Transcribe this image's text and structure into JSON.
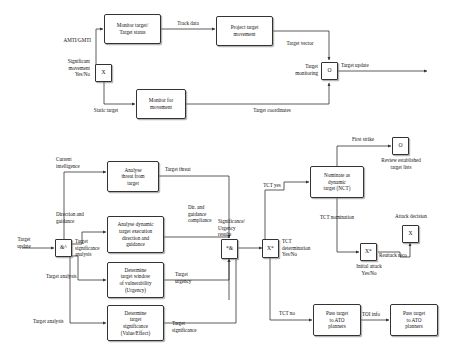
{
  "diagram": {
    "stroke_color": "#333333",
    "background": "#ffffff",
    "nodes": [
      {
        "id": "monitor_target",
        "label": "Monitor target/\nTarget status"
      },
      {
        "id": "project_movement",
        "label": "Project target\nmovement"
      },
      {
        "id": "x_sig_move",
        "label": "X"
      },
      {
        "id": "monitor_for_movement",
        "label": "Monitor for\nmovement"
      },
      {
        "id": "o_target_monitoring",
        "label": "O"
      },
      {
        "id": "amp_junction",
        "label": "&^"
      },
      {
        "id": "analyse_threat",
        "label": "Analyse\nthreat from\ntarget"
      },
      {
        "id": "analyse_dynamic",
        "label": "Analyse dynamic\ntarget execution\ndirection and\nguidance"
      },
      {
        "id": "determine_window",
        "label": "Determine\ntarget window\nof vulnerability\n(Urgency)"
      },
      {
        "id": "determine_significance",
        "label": "Determine\ntarget\nsignificance\n(Value/Effect)"
      },
      {
        "id": "star_amp_junction",
        "label": "*&"
      },
      {
        "id": "x_star_tct",
        "label": "X*"
      },
      {
        "id": "nominate_dynamic",
        "label": "Nominate as\ndynamic\ntarget (NCT)"
      },
      {
        "id": "o_review",
        "label": "O"
      },
      {
        "id": "x_star_initial_attack",
        "label": "X*"
      },
      {
        "id": "x_attack_decision",
        "label": "X"
      },
      {
        "id": "pass_ato_1",
        "label": "Pass target\nto ATO\nplanners"
      },
      {
        "id": "pass_ato_2",
        "label": "Pass target\nto ATO\nplanners"
      }
    ],
    "labels": [
      {
        "id": "amti_gmti",
        "text": "AMTI/GMTI"
      },
      {
        "id": "significant_movement",
        "text": "Significant\nmovement\nYes/No"
      },
      {
        "id": "static_target",
        "text": "Static target"
      },
      {
        "id": "track_data",
        "text": "Track data"
      },
      {
        "id": "target_vector",
        "text": "Target vector"
      },
      {
        "id": "target_monitoring",
        "text": "Target\nmonitoring"
      },
      {
        "id": "target_update_out",
        "text": "Target update"
      },
      {
        "id": "target_coordinates",
        "text": "Target coordinates"
      },
      {
        "id": "current_intelligence",
        "text": "Current\nintelligence"
      },
      {
        "id": "direction_and_guidance",
        "text": "Direction and\nguidance"
      },
      {
        "id": "target_update_in",
        "text": "Target\nupdate"
      },
      {
        "id": "target_significance_analysis",
        "text": "Target\nsignificance\nanalysis"
      },
      {
        "id": "target_analysis_1",
        "text": "Target analysis"
      },
      {
        "id": "target_analysis_2",
        "text": "Target analysis"
      },
      {
        "id": "target_threat",
        "text": "Target threat"
      },
      {
        "id": "dir_guidance_compliance",
        "text": "Dir. and\nguidance\ncompliance"
      },
      {
        "id": "target_urgency",
        "text": "Target\nurgency"
      },
      {
        "id": "target_significance_out",
        "text": "Target\nsignificance"
      },
      {
        "id": "significance_urgency_results",
        "text": "Significance/\nUrgency\nresults"
      },
      {
        "id": "tct_determination",
        "text": "TCT\ndetermination\nYes/No"
      },
      {
        "id": "tct_yes",
        "text": "TCT yes"
      },
      {
        "id": "tct_no",
        "text": "TCT no"
      },
      {
        "id": "tct_nomination",
        "text": "TCT nomination"
      },
      {
        "id": "first_strike",
        "text": "First strike"
      },
      {
        "id": "review_established",
        "text": "Review established\ntarget lists"
      },
      {
        "id": "attack_decision",
        "text": "Attack decision"
      },
      {
        "id": "initial_attack",
        "text": "Initial attack\nYes/No"
      },
      {
        "id": "reattack_reco",
        "text": "Reattack reco"
      },
      {
        "id": "toi_info",
        "text": "TOI info"
      }
    ]
  }
}
